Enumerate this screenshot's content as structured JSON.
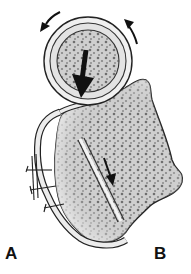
{
  "figure": {
    "type": "anatomical-illustration",
    "labels": {
      "left": "A",
      "right": "B"
    },
    "arrows": [
      {
        "name": "rotation-arrow-left",
        "direction": "counterclockwise-up-left"
      },
      {
        "name": "rotation-arrow-right",
        "direction": "counterclockwise-up"
      },
      {
        "name": "compression-arrow",
        "direction": "down"
      },
      {
        "name": "inner-arrow",
        "direction": "down-right"
      }
    ],
    "colors": {
      "outline": "#222222",
      "bone_fill": "#d9d9d9",
      "spongy_dots": "#6f6f6f",
      "graft_fill": "#e8e8e8",
      "arrow": "#111111",
      "background": "#ffffff"
    }
  }
}
